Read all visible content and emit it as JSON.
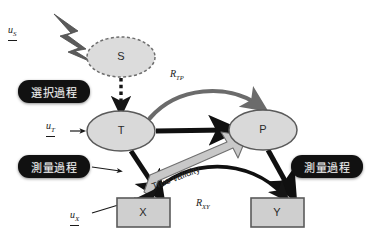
{
  "diagram": {
    "nodes": [
      {
        "id": "S",
        "label": "S",
        "shape": "ellipse-dashed",
        "x": 121,
        "y": 57,
        "rx": 34,
        "ry": 20,
        "fill": "#dcdcdc",
        "stroke": "#6e6e6e"
      },
      {
        "id": "T",
        "label": "T",
        "shape": "ellipse",
        "x": 121,
        "y": 131,
        "rx": 34,
        "ry": 20,
        "fill": "#d9d9d9",
        "stroke": "#5a5a5a"
      },
      {
        "id": "P",
        "label": "P",
        "shape": "ellipse",
        "x": 263,
        "y": 130,
        "rx": 34,
        "ry": 20,
        "fill": "#d9d9d9",
        "stroke": "#5a5a5a"
      },
      {
        "id": "X",
        "label": "X",
        "shape": "rect",
        "x": 143,
        "y": 198,
        "w": 53,
        "h": 29,
        "fill": "#cfcfcf",
        "stroke": "#5a5a5a"
      },
      {
        "id": "Y",
        "label": "Y",
        "shape": "rect",
        "x": 277,
        "y": 198,
        "w": 53,
        "h": 29,
        "fill": "#cfcfcf",
        "stroke": "#5a5a5a"
      }
    ],
    "error_terms": [
      {
        "id": "uS",
        "base": "u",
        "sub": "S",
        "x": 8,
        "y": 24
      },
      {
        "id": "uT",
        "base": "u",
        "sub": "T",
        "x": 46,
        "y": 120
      },
      {
        "id": "uX",
        "base": "u",
        "sub": "X",
        "x": 70,
        "y": 209
      }
    ],
    "correlations": [
      {
        "id": "RTP",
        "base": "R",
        "sub": "TP",
        "x": 170,
        "y": 68
      },
      {
        "id": "RXY",
        "base": "R",
        "sub": "XY",
        "x": 196,
        "y": 197
      }
    ],
    "process_pills": [
      {
        "id": "selection-process",
        "label": "選択過程",
        "x": 18,
        "y": 80,
        "w": 72,
        "h": 23
      },
      {
        "id": "measurement-process-left",
        "label": "測量過程",
        "x": 18,
        "y": 155,
        "w": 72,
        "h": 23
      },
      {
        "id": "measurement-process-right",
        "label": "測量過程",
        "x": 291,
        "y": 155,
        "w": 72,
        "h": 23
      }
    ],
    "banner": {
      "id": "true-validity",
      "label": "True validity",
      "x": 152,
      "y": 181
    },
    "colors": {
      "lightning": "#5b5b5b",
      "arrow_black": "#101010",
      "arrow_gray": "#6b6b6b",
      "banner_fill": "#c8c8c8",
      "banner_stroke": "#6f6f6f",
      "node_fill": "#d9d9d9",
      "pill_bg": "#111111",
      "pill_text": "#f2f2f2",
      "background": "#ffffff"
    }
  }
}
